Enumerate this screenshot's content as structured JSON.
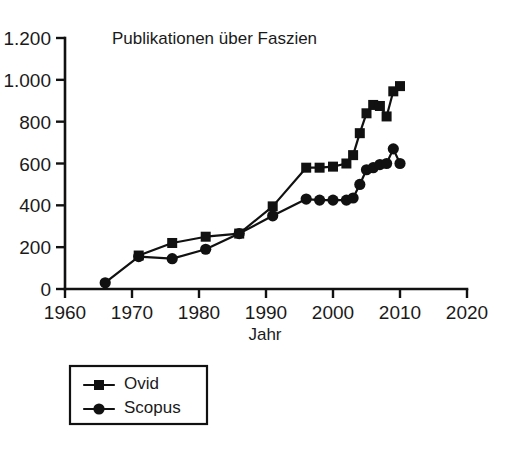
{
  "chart_data": {
    "type": "line",
    "title": "Publikationen über Faszien",
    "xlabel": "Jahr",
    "ylabel": "",
    "xlim": [
      1960,
      2020
    ],
    "ylim": [
      0,
      1200
    ],
    "grid": false,
    "legend_position": "below-left",
    "xticks": [
      1960,
      1970,
      1980,
      1990,
      2000,
      2010,
      2020
    ],
    "xtick_labels": [
      "1960",
      "1970",
      "1980",
      "1990",
      "2000",
      "2010",
      "2020"
    ],
    "yticks": [
      0,
      200,
      400,
      600,
      800,
      1000,
      1200
    ],
    "ytick_labels": [
      "0",
      "200",
      "400",
      "600",
      "800",
      "1.000",
      "1.200"
    ],
    "series": [
      {
        "name": "Ovid",
        "marker": "square",
        "color": "#111111",
        "x": [
          1971,
          1976,
          1981,
          1986,
          1991,
          1996,
          1998,
          2000,
          2002,
          2003,
          2004,
          2005,
          2006,
          2007,
          2008,
          2009,
          2010
        ],
        "values": [
          160,
          220,
          250,
          265,
          395,
          580,
          580,
          585,
          600,
          640,
          745,
          840,
          880,
          875,
          825,
          945,
          970
        ]
      },
      {
        "name": "Scopus",
        "marker": "circle",
        "color": "#111111",
        "x": [
          1966,
          1971,
          1976,
          1981,
          1986,
          1991,
          1996,
          1998,
          2000,
          2002,
          2003,
          2004,
          2005,
          2006,
          2007,
          2008,
          2009,
          2010
        ],
        "values": [
          30,
          155,
          145,
          190,
          265,
          350,
          430,
          425,
          425,
          425,
          435,
          500,
          570,
          580,
          595,
          600,
          670,
          600
        ]
      }
    ]
  },
  "legend": {
    "entries": [
      {
        "label": "Ovid",
        "marker": "square"
      },
      {
        "label": "Scopus",
        "marker": "circle"
      }
    ]
  }
}
